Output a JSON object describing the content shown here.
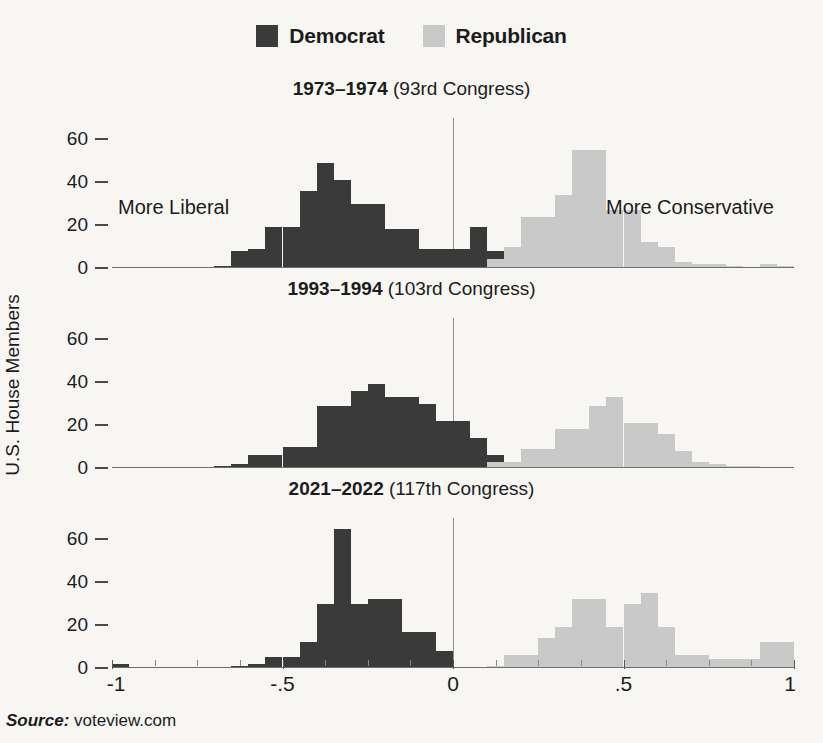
{
  "legend": {
    "items": [
      {
        "label": "Democrat",
        "color": "#3a3a3a",
        "key": "dem"
      },
      {
        "label": "Republican",
        "color": "#c9c9c9",
        "key": "rep"
      }
    ]
  },
  "axis": {
    "y_title": "U.S. House Members",
    "x_labels": [
      "-1",
      "-.5",
      "0",
      ".5",
      "1"
    ],
    "x_label_values": [
      -1,
      -0.5,
      0,
      0.5,
      1
    ],
    "y_ticks": [
      "0",
      "20",
      "40",
      "60"
    ]
  },
  "annotations": {
    "more_liberal": "More Liberal",
    "more_conservative": "More Conservative"
  },
  "source": {
    "label": "Source:",
    "value": "voteview.com"
  },
  "chart_data": {
    "type": "bar",
    "title": "",
    "xlabel": "",
    "ylabel": "U.S. House Members",
    "xlim": [
      -1.0,
      1.0
    ],
    "ylim": [
      0,
      70
    ],
    "grid": false,
    "legend_position": "top-center",
    "bin_width": 0.05,
    "panels": [
      {
        "id": "congress-93",
        "years": "1973–1974",
        "congress": "(93rd Congress)",
        "y_ticks": [
          0,
          20,
          40,
          60
        ],
        "series": [
          {
            "name": "Democrat",
            "color": "#3a3a3a",
            "bins": [
              {
                "x0": -0.7,
                "x1": -0.65,
                "value": 1
              },
              {
                "x0": -0.65,
                "x1": -0.6,
                "value": 8
              },
              {
                "x0": -0.6,
                "x1": -0.55,
                "value": 9
              },
              {
                "x0": -0.55,
                "x1": -0.5,
                "value": 19
              },
              {
                "x0": -0.5,
                "x1": -0.45,
                "value": 19
              },
              {
                "x0": -0.45,
                "x1": -0.4,
                "value": 36
              },
              {
                "x0": -0.4,
                "x1": -0.35,
                "value": 49
              },
              {
                "x0": -0.35,
                "x1": -0.3,
                "value": 41
              },
              {
                "x0": -0.3,
                "x1": -0.25,
                "value": 30
              },
              {
                "x0": -0.25,
                "x1": -0.2,
                "value": 30
              },
              {
                "x0": -0.2,
                "x1": -0.15,
                "value": 18
              },
              {
                "x0": -0.15,
                "x1": -0.1,
                "value": 18
              },
              {
                "x0": -0.1,
                "x1": -0.05,
                "value": 9
              },
              {
                "x0": -0.05,
                "x1": 0.0,
                "value": 9
              },
              {
                "x0": 0.0,
                "x1": 0.05,
                "value": 9
              },
              {
                "x0": 0.05,
                "x1": 0.1,
                "value": 19
              },
              {
                "x0": 0.1,
                "x1": 0.15,
                "value": 8
              }
            ]
          },
          {
            "name": "Republican",
            "color": "#c9c9c9",
            "bins": [
              {
                "x0": 0.1,
                "x1": 0.15,
                "value": 4
              },
              {
                "x0": 0.15,
                "x1": 0.2,
                "value": 10
              },
              {
                "x0": 0.2,
                "x1": 0.25,
                "value": 24
              },
              {
                "x0": 0.25,
                "x1": 0.3,
                "value": 24
              },
              {
                "x0": 0.3,
                "x1": 0.35,
                "value": 34
              },
              {
                "x0": 0.35,
                "x1": 0.4,
                "value": 55
              },
              {
                "x0": 0.4,
                "x1": 0.45,
                "value": 55
              },
              {
                "x0": 0.45,
                "x1": 0.5,
                "value": 27
              },
              {
                "x0": 0.5,
                "x1": 0.55,
                "value": 27
              },
              {
                "x0": 0.55,
                "x1": 0.6,
                "value": 12
              },
              {
                "x0": 0.6,
                "x1": 0.65,
                "value": 10
              },
              {
                "x0": 0.65,
                "x1": 0.7,
                "value": 3
              },
              {
                "x0": 0.7,
                "x1": 0.75,
                "value": 2
              },
              {
                "x0": 0.75,
                "x1": 0.8,
                "value": 2
              },
              {
                "x0": 0.8,
                "x1": 0.85,
                "value": 1
              },
              {
                "x0": 0.9,
                "x1": 0.95,
                "value": 2
              },
              {
                "x0": 0.95,
                "x1": 1.0,
                "value": 1
              }
            ]
          }
        ]
      },
      {
        "id": "congress-103",
        "years": "1993–1994",
        "congress": "(103rd Congress)",
        "y_ticks": [
          0,
          20,
          40,
          60
        ],
        "series": [
          {
            "name": "Democrat",
            "color": "#3a3a3a",
            "bins": [
              {
                "x0": -0.7,
                "x1": -0.65,
                "value": 1
              },
              {
                "x0": -0.65,
                "x1": -0.6,
                "value": 2
              },
              {
                "x0": -0.6,
                "x1": -0.55,
                "value": 6
              },
              {
                "x0": -0.55,
                "x1": -0.5,
                "value": 6
              },
              {
                "x0": -0.5,
                "x1": -0.45,
                "value": 10
              },
              {
                "x0": -0.45,
                "x1": -0.4,
                "value": 10
              },
              {
                "x0": -0.4,
                "x1": -0.35,
                "value": 29
              },
              {
                "x0": -0.35,
                "x1": -0.3,
                "value": 29
              },
              {
                "x0": -0.3,
                "x1": -0.25,
                "value": 36
              },
              {
                "x0": -0.25,
                "x1": -0.2,
                "value": 39
              },
              {
                "x0": -0.2,
                "x1": -0.15,
                "value": 33
              },
              {
                "x0": -0.15,
                "x1": -0.1,
                "value": 33
              },
              {
                "x0": -0.1,
                "x1": -0.05,
                "value": 30
              },
              {
                "x0": -0.05,
                "x1": 0.0,
                "value": 22
              },
              {
                "x0": 0.0,
                "x1": 0.05,
                "value": 22
              },
              {
                "x0": 0.05,
                "x1": 0.1,
                "value": 14
              },
              {
                "x0": 0.1,
                "x1": 0.15,
                "value": 6
              }
            ]
          },
          {
            "name": "Republican",
            "color": "#c9c9c9",
            "bins": [
              {
                "x0": 0.1,
                "x1": 0.15,
                "value": 3
              },
              {
                "x0": 0.15,
                "x1": 0.2,
                "value": 3
              },
              {
                "x0": 0.2,
                "x1": 0.25,
                "value": 9
              },
              {
                "x0": 0.25,
                "x1": 0.3,
                "value": 9
              },
              {
                "x0": 0.3,
                "x1": 0.35,
                "value": 18
              },
              {
                "x0": 0.35,
                "x1": 0.4,
                "value": 18
              },
              {
                "x0": 0.4,
                "x1": 0.45,
                "value": 29
              },
              {
                "x0": 0.45,
                "x1": 0.5,
                "value": 33
              },
              {
                "x0": 0.5,
                "x1": 0.55,
                "value": 21
              },
              {
                "x0": 0.55,
                "x1": 0.6,
                "value": 21
              },
              {
                "x0": 0.6,
                "x1": 0.65,
                "value": 16
              },
              {
                "x0": 0.65,
                "x1": 0.7,
                "value": 8
              },
              {
                "x0": 0.7,
                "x1": 0.75,
                "value": 3
              },
              {
                "x0": 0.75,
                "x1": 0.8,
                "value": 2
              },
              {
                "x0": 0.8,
                "x1": 0.85,
                "value": 1
              },
              {
                "x0": 0.85,
                "x1": 0.9,
                "value": 1
              }
            ]
          }
        ]
      },
      {
        "id": "congress-117",
        "years": "2021–2022",
        "congress": "(117th Congress)",
        "y_ticks": [
          0,
          20,
          40,
          60
        ],
        "series": [
          {
            "name": "Democrat",
            "color": "#3a3a3a",
            "bins": [
              {
                "x0": -1.0,
                "x1": -0.95,
                "value": 2
              },
              {
                "x0": -0.65,
                "x1": -0.6,
                "value": 1
              },
              {
                "x0": -0.6,
                "x1": -0.55,
                "value": 2
              },
              {
                "x0": -0.55,
                "x1": -0.5,
                "value": 5
              },
              {
                "x0": -0.5,
                "x1": -0.45,
                "value": 5
              },
              {
                "x0": -0.45,
                "x1": -0.4,
                "value": 12
              },
              {
                "x0": -0.4,
                "x1": -0.35,
                "value": 30
              },
              {
                "x0": -0.35,
                "x1": -0.3,
                "value": 65
              },
              {
                "x0": -0.3,
                "x1": -0.25,
                "value": 30
              },
              {
                "x0": -0.25,
                "x1": -0.2,
                "value": 32
              },
              {
                "x0": -0.2,
                "x1": -0.15,
                "value": 32
              },
              {
                "x0": -0.15,
                "x1": -0.1,
                "value": 17
              },
              {
                "x0": -0.1,
                "x1": -0.05,
                "value": 17
              },
              {
                "x0": -0.05,
                "x1": 0.0,
                "value": 8
              }
            ]
          },
          {
            "name": "Republican",
            "color": "#c9c9c9",
            "bins": [
              {
                "x0": 0.1,
                "x1": 0.15,
                "value": 1
              },
              {
                "x0": 0.15,
                "x1": 0.2,
                "value": 6
              },
              {
                "x0": 0.2,
                "x1": 0.25,
                "value": 6
              },
              {
                "x0": 0.25,
                "x1": 0.3,
                "value": 14
              },
              {
                "x0": 0.3,
                "x1": 0.35,
                "value": 19
              },
              {
                "x0": 0.35,
                "x1": 0.4,
                "value": 32
              },
              {
                "x0": 0.4,
                "x1": 0.45,
                "value": 32
              },
              {
                "x0": 0.45,
                "x1": 0.5,
                "value": 19
              },
              {
                "x0": 0.5,
                "x1": 0.55,
                "value": 30
              },
              {
                "x0": 0.55,
                "x1": 0.6,
                "value": 35
              },
              {
                "x0": 0.6,
                "x1": 0.65,
                "value": 19
              },
              {
                "x0": 0.65,
                "x1": 0.7,
                "value": 6
              },
              {
                "x0": 0.7,
                "x1": 0.75,
                "value": 6
              },
              {
                "x0": 0.75,
                "x1": 0.8,
                "value": 4
              },
              {
                "x0": 0.8,
                "x1": 0.85,
                "value": 4
              },
              {
                "x0": 0.85,
                "x1": 0.9,
                "value": 4
              },
              {
                "x0": 0.9,
                "x1": 0.95,
                "value": 12
              },
              {
                "x0": 0.95,
                "x1": 1.0,
                "value": 12
              }
            ]
          }
        ]
      }
    ]
  }
}
